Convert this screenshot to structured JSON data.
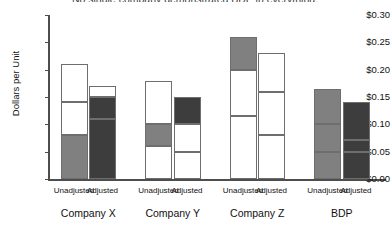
{
  "chart_data": {
    "type": "bar",
    "subtype": "stacked-grouped",
    "title": "No single company demonstrated BDP in everything.",
    "xlabel": "",
    "ylabel": "Dollars per Unit",
    "ylim": [
      0.0,
      0.3
    ],
    "ytick_labels": [
      "$0.00",
      "$0.05",
      "$0.10",
      "$0.15",
      "$0.20",
      "$0.25",
      "$0.30"
    ],
    "ytick_values": [
      0.0,
      0.05,
      0.1,
      0.15,
      0.2,
      0.25,
      0.3
    ],
    "grid": false,
    "legend": null,
    "groups": [
      "Company X",
      "Company Y",
      "Company Z",
      "BDP"
    ],
    "subcategories": [
      "Unadjusted",
      "Adjusted"
    ],
    "colors": {
      "white": "#ffffff",
      "gray": "#808080",
      "dark": "#3d3d3d",
      "outline": "#6e6e6e",
      "axis": "#4d4d4d"
    },
    "bars": [
      {
        "group": "Company X",
        "sub": "Unadjusted",
        "total": 0.21,
        "segments": [
          {
            "from": 0.0,
            "to": 0.08,
            "value": 0.08,
            "shade": "gray"
          },
          {
            "from": 0.08,
            "to": 0.14,
            "value": 0.06,
            "shade": "white"
          },
          {
            "from": 0.14,
            "to": 0.21,
            "value": 0.07,
            "shade": "white"
          }
        ]
      },
      {
        "group": "Company X",
        "sub": "Adjusted",
        "total": 0.17,
        "segments": [
          {
            "from": 0.0,
            "to": 0.11,
            "value": 0.11,
            "shade": "dark"
          },
          {
            "from": 0.11,
            "to": 0.15,
            "value": 0.04,
            "shade": "dark"
          },
          {
            "from": 0.15,
            "to": 0.17,
            "value": 0.02,
            "shade": "white"
          }
        ]
      },
      {
        "group": "Company Y",
        "sub": "Unadjusted",
        "total": 0.18,
        "segments": [
          {
            "from": 0.0,
            "to": 0.06,
            "value": 0.06,
            "shade": "white"
          },
          {
            "from": 0.06,
            "to": 0.1,
            "value": 0.04,
            "shade": "gray"
          },
          {
            "from": 0.1,
            "to": 0.18,
            "value": 0.08,
            "shade": "white"
          }
        ]
      },
      {
        "group": "Company Y",
        "sub": "Adjusted",
        "total": 0.15,
        "segments": [
          {
            "from": 0.0,
            "to": 0.05,
            "value": 0.05,
            "shade": "white"
          },
          {
            "from": 0.05,
            "to": 0.1,
            "value": 0.05,
            "shade": "white"
          },
          {
            "from": 0.1,
            "to": 0.15,
            "value": 0.05,
            "shade": "dark"
          }
        ]
      },
      {
        "group": "Company Z",
        "sub": "Unadjusted",
        "total": 0.26,
        "segments": [
          {
            "from": 0.0,
            "to": 0.115,
            "value": 0.115,
            "shade": "white"
          },
          {
            "from": 0.115,
            "to": 0.2,
            "value": 0.085,
            "shade": "white"
          },
          {
            "from": 0.2,
            "to": 0.26,
            "value": 0.06,
            "shade": "gray"
          }
        ]
      },
      {
        "group": "Company Z",
        "sub": "Adjusted",
        "total": 0.23,
        "segments": [
          {
            "from": 0.0,
            "to": 0.08,
            "value": 0.08,
            "shade": "white"
          },
          {
            "from": 0.08,
            "to": 0.16,
            "value": 0.08,
            "shade": "white"
          },
          {
            "from": 0.16,
            "to": 0.23,
            "value": 0.07,
            "shade": "white"
          }
        ]
      },
      {
        "group": "BDP",
        "sub": "Unadjusted",
        "total": 0.165,
        "segments": [
          {
            "from": 0.0,
            "to": 0.05,
            "value": 0.05,
            "shade": "gray"
          },
          {
            "from": 0.05,
            "to": 0.1,
            "value": 0.05,
            "shade": "gray"
          },
          {
            "from": 0.1,
            "to": 0.165,
            "value": 0.065,
            "shade": "gray"
          }
        ]
      },
      {
        "group": "BDP",
        "sub": "Adjusted",
        "total": 0.14,
        "segments": [
          {
            "from": 0.0,
            "to": 0.05,
            "value": 0.05,
            "shade": "dark"
          },
          {
            "from": 0.05,
            "to": 0.072,
            "value": 0.022,
            "shade": "dark"
          },
          {
            "from": 0.072,
            "to": 0.14,
            "value": 0.068,
            "shade": "dark"
          }
        ]
      }
    ]
  }
}
